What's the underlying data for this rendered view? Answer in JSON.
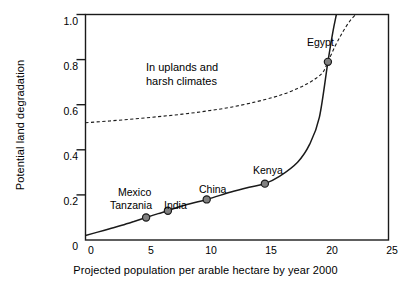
{
  "chart_data": {
    "type": "line",
    "title": "",
    "xlabel": "Projected population per arable hectare by year 2000",
    "ylabel": "Potential land degradation",
    "xlim": [
      0,
      25
    ],
    "ylim": [
      0,
      1.0
    ],
    "grid": false,
    "legend": "none",
    "xticks": [
      "0",
      "5",
      "10",
      "15",
      "20",
      "25"
    ],
    "xtick_values": [
      0,
      5,
      10,
      15,
      20,
      25
    ],
    "yticks": [
      "0",
      "0.2",
      "0.4",
      "0.6",
      "0.8",
      "1.0"
    ],
    "ytick_values": [
      0,
      0.2,
      0.4,
      0.6,
      0.8,
      1.0
    ],
    "series": [
      {
        "name": "Normal conditions",
        "style": "solid",
        "color": "#1a1a1a",
        "x": [
          0.0,
          1.0,
          2.0,
          3.0,
          4.0,
          5.0,
          6.0,
          6.8,
          8.0,
          10.0,
          12.0,
          13.5,
          14.8,
          16.0,
          17.5,
          18.5,
          19.3,
          20.0,
          20.4,
          20.7
        ],
        "y": [
          0.02,
          0.035,
          0.05,
          0.065,
          0.082,
          0.1,
          0.117,
          0.13,
          0.152,
          0.18,
          0.213,
          0.234,
          0.25,
          0.282,
          0.345,
          0.425,
          0.545,
          0.79,
          0.92,
          1.0
        ]
      },
      {
        "name": "In uplands and harsh climates",
        "style": "dashed",
        "color": "#1a1a1a",
        "x": [
          0.0,
          2.0,
          4.0,
          6.0,
          8.0,
          10.0,
          12.0,
          14.0,
          15.5,
          16.5,
          17.5,
          18.3,
          19.0,
          19.6,
          20.0,
          20.6,
          21.2,
          21.8,
          22.3
        ],
        "y": [
          0.52,
          0.528,
          0.537,
          0.547,
          0.558,
          0.572,
          0.589,
          0.612,
          0.633,
          0.65,
          0.672,
          0.693,
          0.716,
          0.745,
          0.79,
          0.86,
          0.92,
          0.97,
          1.0
        ]
      }
    ],
    "points": [
      {
        "label": "Mexico\nTanzania",
        "label_line1": "Mexico",
        "label_line2": "Tanzania",
        "x": 5.0,
        "y": 0.1
      },
      {
        "label": "India",
        "x": 6.8,
        "y": 0.13
      },
      {
        "label": "China",
        "x": 10.0,
        "y": 0.18
      },
      {
        "label": "Kenya",
        "x": 14.8,
        "y": 0.25
      },
      {
        "label": "Egypt",
        "x": 20.0,
        "y": 0.79
      }
    ],
    "annotations": [
      {
        "text_line1": "In uplands and",
        "text_line2": "harsh climates",
        "x": 4.2,
        "y": 0.73
      }
    ],
    "marker_fill": "#808080",
    "marker_edge": "#1a1a1a",
    "axis_color": "#1a1a1a"
  },
  "axis": {
    "ylabel": "Potential land degradation",
    "xlabel": "Projected population per arable hectare by year 2000",
    "ytick_labels": [
      "1.0",
      "0.8",
      "0.6",
      "0.4",
      "0.2",
      "0"
    ],
    "xtick_labels": [
      "0",
      "5",
      "10",
      "15",
      "20",
      "25"
    ]
  },
  "annotation": {
    "line1": "In uplands and",
    "line2": "harsh climates"
  },
  "point_labels": {
    "mexico": "Mexico",
    "tanzania": "Tanzania",
    "india": "India",
    "china": "China",
    "kenya": "Kenya",
    "egypt": "Egypt"
  }
}
